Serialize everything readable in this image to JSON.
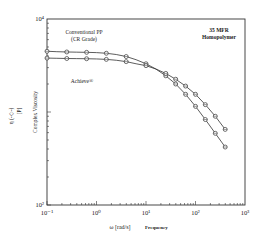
{
  "chart_data": {
    "type": "line",
    "title": "35 MFR Homopolymer",
    "title_lines": [
      "35 MFR",
      "Homopolymer"
    ],
    "xlabel": "ω [rad/s]",
    "xlabel_suffix": "Frequency",
    "ylabel": "Complex Viscosity",
    "ylabel_symbol": "η (-◇-)",
    "ylabel_unit": "[P]",
    "x_scale": "log",
    "y_scale": "log",
    "xlim": [
      0.1,
      1000
    ],
    "ylim": [
      100,
      10000
    ],
    "x_ticks": [
      "10⁻¹",
      "10⁰",
      "10¹",
      "10²",
      "10³"
    ],
    "y_ticks": [
      "10²",
      "10⁴"
    ],
    "grid": false,
    "series": [
      {
        "name": "Conventional PP (CR Grade)",
        "label_lines": [
          "Conventional PP",
          "(CR Grade)"
        ],
        "marker": "open-circle",
        "x": [
          0.1,
          0.158,
          0.251,
          0.398,
          0.631,
          1.0,
          1.58,
          2.51,
          3.98,
          6.31,
          10,
          15.8,
          25.1,
          39.8,
          63.1,
          100,
          158,
          251,
          398
        ],
        "y": [
          4500,
          4450,
          4420,
          4400,
          4380,
          4350,
          4280,
          4150,
          3950,
          3650,
          3300,
          2900,
          2450,
          2000,
          1550,
          1150,
          830,
          590,
          420
        ]
      },
      {
        "name": "Achieve®",
        "label_lines": [
          "Achieve®"
        ],
        "marker": "open-circle",
        "x": [
          0.1,
          0.158,
          0.251,
          0.398,
          0.631,
          1.0,
          1.58,
          2.51,
          3.98,
          6.31,
          10,
          15.8,
          25.1,
          39.8,
          63.1,
          100,
          158,
          251,
          398
        ],
        "y": [
          3800,
          3780,
          3760,
          3750,
          3740,
          3720,
          3680,
          3600,
          3480,
          3300,
          3150,
          2900,
          2600,
          2250,
          1900,
          1550,
          1200,
          900,
          650
        ]
      }
    ]
  }
}
